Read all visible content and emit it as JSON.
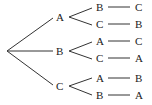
{
  "diagram": {
    "type": "tree",
    "root": "",
    "level1": [
      {
        "label": "A",
        "children": [
          {
            "label": "B",
            "leaf": "C"
          },
          {
            "label": "C",
            "leaf": "B"
          }
        ]
      },
      {
        "label": "B",
        "children": [
          {
            "label": "A",
            "leaf": "C"
          },
          {
            "label": "C",
            "leaf": "A"
          }
        ]
      },
      {
        "label": "C",
        "children": [
          {
            "label": "A",
            "leaf": "B"
          },
          {
            "label": "B",
            "leaf": "A"
          }
        ]
      }
    ]
  }
}
